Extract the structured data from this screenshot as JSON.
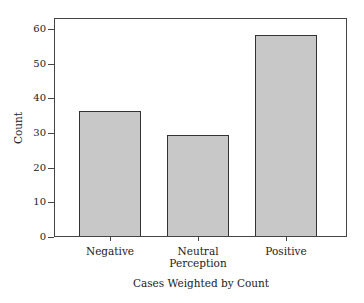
{
  "chart_data": {
    "type": "bar",
    "title": "",
    "categories": [
      "Negative",
      "Neutral Perception",
      "Positive"
    ],
    "category_lines": [
      [
        "Negative"
      ],
      [
        "Neutral",
        "Perception"
      ],
      [
        "Positive"
      ]
    ],
    "values": [
      36,
      29,
      58
    ],
    "xlabel": "Cases Weighted by Count",
    "ylabel": "Count",
    "ylim": [
      0,
      63
    ],
    "yticks": [
      0,
      10,
      20,
      30,
      40,
      50,
      60
    ],
    "grid": false,
    "legend": null,
    "bar_color": "#c8c8c8",
    "edge_color": "#333333"
  }
}
